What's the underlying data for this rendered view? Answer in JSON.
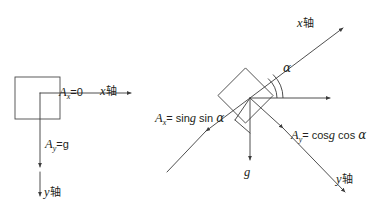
{
  "figure": {
    "background_color": "#ffffff",
    "line_color": "#3b3b3b",
    "text_color": "#231f20",
    "width": 381,
    "height": 216
  },
  "left_diagram": {
    "name": "free-fall-frame",
    "block_label": "",
    "axis_x_label": "x轴",
    "axis_y_label": "y轴",
    "accel_x": {
      "symbol": "A",
      "subscript": "x",
      "equation": "=0",
      "full": "Ax=0"
    },
    "accel_y": {
      "symbol": "A",
      "subscript": "y",
      "equation": "=g",
      "full": "Ay=g"
    }
  },
  "right_diagram": {
    "name": "rotated-frame",
    "axis_x_label": "x轴",
    "axis_y_label": "y轴",
    "angle_label": "α",
    "gravity_label": "g",
    "accel_x": {
      "symbol": "A",
      "subscript": "x",
      "equation": "=g sin",
      "angle": "α",
      "full": "Ax=g sin α"
    },
    "accel_y": {
      "symbol": "A",
      "subscript": "y",
      "equation": "=g cos",
      "angle": "α",
      "full": "Ay=g cos α"
    }
  }
}
